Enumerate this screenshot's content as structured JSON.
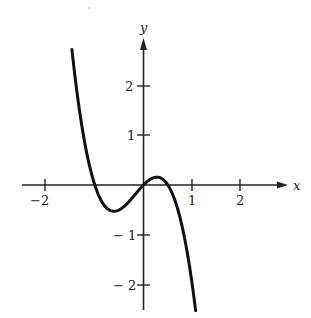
{
  "chart_data": {
    "type": "line",
    "title": "",
    "xlabel": "x",
    "ylabel": "y",
    "function": "y = -2x^3 - x^2 + x",
    "xlim": [
      -2.5,
      2.9
    ],
    "ylim": [
      -2.5,
      3.0
    ],
    "x_ticks": [
      -2,
      1,
      2
    ],
    "x_tick_labels": [
      "-2",
      "1",
      "2"
    ],
    "y_ticks": [
      2,
      1,
      -1,
      -2
    ],
    "y_tick_labels": [
      "2",
      "1",
      "-1",
      "-2"
    ],
    "grid": false,
    "legend": null,
    "curve_domain": [
      -1.47,
      1.07
    ],
    "key_points": [
      {
        "label": "left-start",
        "x": -1.47,
        "y": 2.72
      },
      {
        "label": "root",
        "x": -1.0,
        "y": 0
      },
      {
        "label": "local-min",
        "x": -0.61,
        "y": -0.53
      },
      {
        "label": "root",
        "x": 0,
        "y": 0
      },
      {
        "label": "local-max",
        "x": 0.27,
        "y": 0.16
      },
      {
        "label": "root",
        "x": 0.5,
        "y": 0
      },
      {
        "label": "right-end",
        "x": 1.07,
        "y": -2.51
      }
    ],
    "series": [
      {
        "name": "f(x)",
        "x": [
          -1.47,
          -1.4,
          -1.3,
          -1.2,
          -1.1,
          -1.0,
          -0.9,
          -0.8,
          -0.7,
          -0.6,
          -0.5,
          -0.4,
          -0.3,
          -0.2,
          -0.1,
          0.0,
          0.1,
          0.2,
          0.27,
          0.35,
          0.4,
          0.5,
          0.6,
          0.7,
          0.8,
          0.9,
          1.0,
          1.07
        ],
        "values": [
          2.72,
          2.13,
          1.4,
          0.82,
          0.35,
          0.0,
          -0.26,
          -0.42,
          -0.5,
          -0.53,
          -0.5,
          -0.43,
          -0.34,
          -0.22,
          -0.11,
          0.0,
          0.08,
          0.14,
          0.16,
          0.14,
          0.11,
          0.0,
          -0.19,
          -0.88,
          -0.86,
          -1.17,
          -2.0,
          -2.51
        ]
      }
    ]
  },
  "labels": {
    "x_axis": "x",
    "y_axis": "y",
    "x_ticks": [
      "−2",
      "1",
      "2"
    ],
    "y_ticks": [
      "2",
      "1",
      "− 1",
      "− 2"
    ]
  },
  "colors": {
    "curve": "#111111",
    "axes": "#222222",
    "background": "#ffffff"
  }
}
